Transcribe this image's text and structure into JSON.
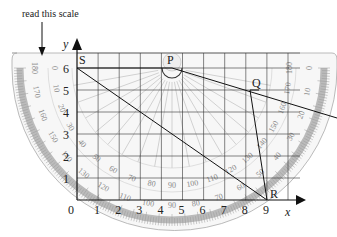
{
  "annotation": {
    "text": "read this scale"
  },
  "axes": {
    "x_label": "x",
    "y_label": "y",
    "x_ticks": [
      "0",
      "1",
      "2",
      "3",
      "4",
      "5",
      "6",
      "7",
      "8",
      "9"
    ],
    "y_ticks": [
      "1",
      "2",
      "3",
      "4",
      "5",
      "6"
    ]
  },
  "points": [
    {
      "name": "S",
      "x": 0,
      "y": 6
    },
    {
      "name": "P",
      "x": 4.5,
      "y": 6
    },
    {
      "name": "Q",
      "x": 8.5,
      "y": 5
    },
    {
      "name": "R",
      "x": 9,
      "y": 0
    }
  ],
  "protractor": {
    "inner_scale": [
      "0",
      "10",
      "20",
      "30",
      "40",
      "50",
      "60",
      "70",
      "80",
      "90",
      "100",
      "110",
      "120",
      "130",
      "140",
      "150",
      "160",
      "170",
      "180"
    ],
    "outer_scale": [
      "180",
      "170",
      "160",
      "150",
      "140",
      "130",
      "120",
      "110",
      "100",
      "90",
      "80",
      "70",
      "60",
      "50",
      "40",
      "30",
      "20",
      "10",
      "0"
    ]
  },
  "colors": {
    "grid": "#333333",
    "protractor_band": "#bbbbbb",
    "scale_text": "#888888"
  }
}
